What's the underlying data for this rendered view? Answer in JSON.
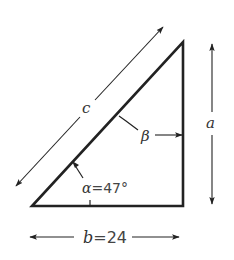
{
  "diagram": {
    "type": "right-triangle",
    "stroke_color": "#222222",
    "vertices": {
      "bottom_left": [
        32,
        206
      ],
      "bottom_right": [
        183,
        206
      ],
      "top": [
        183,
        42
      ]
    },
    "labels": {
      "hypotenuse": "c",
      "vertical_side": "a",
      "base_symbol": "b",
      "base_eq": "=24",
      "alpha_symbol": "α",
      "alpha_eq": "=47°",
      "beta": "β"
    },
    "values": {
      "b": 24,
      "alpha_deg": 47
    }
  }
}
